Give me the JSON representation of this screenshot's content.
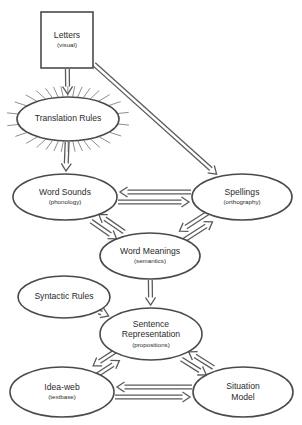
{
  "diagram": {
    "background_color": "#ffffff",
    "stroke_color": "#4a4a4a",
    "arrow_color": "#5a5a5a",
    "ray_color": "#8f8f8f",
    "nodes": [
      {
        "id": "letters",
        "shape": "rectangle",
        "label": "Letters",
        "sublabel": "(visual)",
        "cx": 67,
        "cy": 40,
        "w": 52,
        "h": 56,
        "decoration": "none"
      },
      {
        "id": "translation-rules",
        "shape": "ellipse",
        "label": "Translation Rules",
        "sublabel": "",
        "cx": 68,
        "cy": 119,
        "rx": 51,
        "ry": 22,
        "decoration": "sunburst"
      },
      {
        "id": "word-sounds",
        "shape": "ellipse",
        "label": "Word Sounds",
        "sublabel": "(phonology)",
        "cx": 65,
        "cy": 197,
        "rx": 52,
        "ry": 23,
        "decoration": "none"
      },
      {
        "id": "spellings",
        "shape": "ellipse",
        "label": "Spellings",
        "sublabel": "(orthography)",
        "cx": 242,
        "cy": 197,
        "rx": 50,
        "ry": 23,
        "decoration": "none"
      },
      {
        "id": "word-meanings",
        "shape": "ellipse",
        "label": "Word Meanings",
        "sublabel": "(semantics)",
        "cx": 150,
        "cy": 256,
        "rx": 50,
        "ry": 23,
        "decoration": "none"
      },
      {
        "id": "syntactic-rules",
        "shape": "ellipse",
        "label": "Syntactic Rules",
        "sublabel": "",
        "cx": 64,
        "cy": 297,
        "rx": 46,
        "ry": 21,
        "decoration": "none"
      },
      {
        "id": "sentence-representation",
        "shape": "ellipse",
        "label": "Sentence Representation",
        "sublabel": "(propositions)",
        "cx": 151,
        "cy": 334,
        "rx": 51,
        "ry": 26,
        "decoration": "none"
      },
      {
        "id": "idea-web",
        "shape": "ellipse",
        "label": "Idea-web",
        "sublabel": "(textbase)",
        "cx": 62,
        "cy": 392,
        "rx": 52,
        "ry": 25,
        "decoration": "none"
      },
      {
        "id": "situation-model",
        "shape": "ellipse",
        "label": "Situation Model",
        "sublabel": "",
        "cx": 243,
        "cy": 392,
        "rx": 50,
        "ry": 25,
        "decoration": "none"
      }
    ],
    "edges": [
      {
        "id": "letters-to-translation",
        "from": "letters",
        "to": "translation-rules",
        "direction": "one-way"
      },
      {
        "id": "letters-to-spellings",
        "from": "letters",
        "to": "spellings",
        "direction": "one-way"
      },
      {
        "id": "translation-to-word-sounds",
        "from": "translation-rules",
        "to": "word-sounds",
        "direction": "one-way"
      },
      {
        "id": "word-sounds-spellings",
        "from": "word-sounds",
        "to": "spellings",
        "direction": "two-way"
      },
      {
        "id": "word-sounds-word-meanings",
        "from": "word-sounds",
        "to": "word-meanings",
        "direction": "two-way"
      },
      {
        "id": "spellings-word-meanings",
        "from": "spellings",
        "to": "word-meanings",
        "direction": "two-way"
      },
      {
        "id": "word-meanings-to-sentence",
        "from": "word-meanings",
        "to": "sentence-representation",
        "direction": "one-way"
      },
      {
        "id": "syntactic-to-sentence",
        "from": "syntactic-rules",
        "to": "sentence-representation",
        "direction": "one-way"
      },
      {
        "id": "sentence-idea-web",
        "from": "sentence-representation",
        "to": "idea-web",
        "direction": "two-way"
      },
      {
        "id": "sentence-situation-model",
        "from": "sentence-representation",
        "to": "situation-model",
        "direction": "two-way"
      },
      {
        "id": "idea-web-situation-model",
        "from": "idea-web",
        "to": "situation-model",
        "direction": "two-way"
      }
    ]
  }
}
